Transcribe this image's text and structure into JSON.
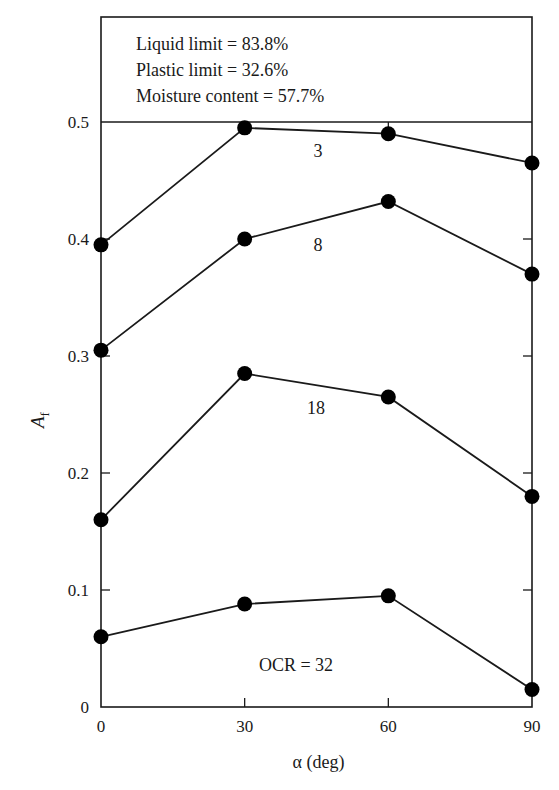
{
  "chart_data": {
    "type": "line",
    "title": "",
    "xlabel": "α (deg)",
    "ylabel": "A",
    "ylabel_subscript": "f",
    "x": [
      0,
      30,
      60,
      90
    ],
    "xlim": [
      0,
      90
    ],
    "ylim": [
      0,
      0.5
    ],
    "xticks": [
      "0",
      "30",
      "60",
      "90"
    ],
    "yticks": [
      "0",
      "0.1",
      "0.2",
      "0.3",
      "0.4",
      "0.5"
    ],
    "grid": false,
    "legend": "none (series labeled inline)",
    "annotation_box": [
      "Liquid limit = 83.8%",
      "Plastic limit = 32.6%",
      "Moisture content = 57.7%"
    ],
    "series": [
      {
        "name": "3",
        "label": "3",
        "values": [
          0.395,
          0.495,
          0.49,
          0.465
        ]
      },
      {
        "name": "8",
        "label": "8",
        "values": [
          0.305,
          0.4,
          0.432,
          0.37
        ]
      },
      {
        "name": "18",
        "label": "18",
        "values": [
          0.16,
          0.285,
          0.265,
          0.18
        ]
      },
      {
        "name": "32",
        "label": "OCR = 32",
        "values": [
          0.06,
          0.088,
          0.095,
          0.015
        ]
      }
    ],
    "marker": "filled circle",
    "line_color": "#1a1a1a"
  }
}
